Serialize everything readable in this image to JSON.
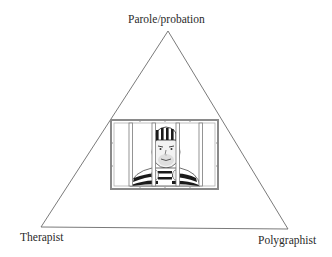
{
  "diagram": {
    "type": "triangle",
    "vertices": {
      "top": "Parole/probation",
      "bottom_left": "Therapist",
      "bottom_right": "Polygraphist"
    },
    "center_image": "prisoner-behind-bars",
    "colors": {
      "line": "#6b6b6b",
      "text": "#2a2a2a",
      "frame": "#8a8a8a",
      "stripes": "#1a1a1a"
    }
  }
}
